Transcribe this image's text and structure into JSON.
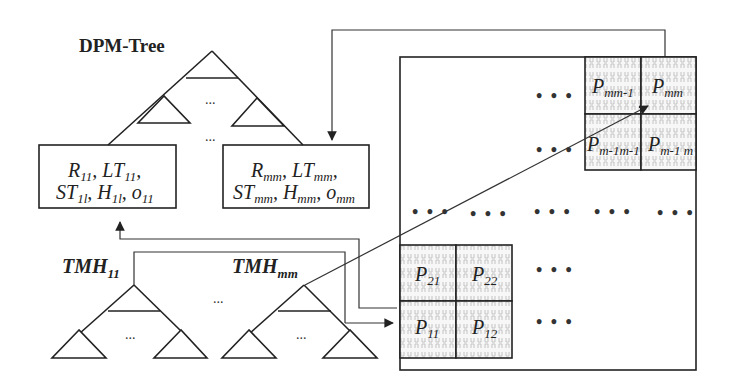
{
  "diagram": {
    "title": "DPM-Tree",
    "ellipsis": "...",
    "middle_dots": "…",
    "leaf_nodes": [
      {
        "id": "node-11",
        "line1": {
          "parts": [
            {
              "base": "R",
              "sub": "11"
            },
            {
              "base": ", LT",
              "sub": "11"
            },
            {
              "base": ",",
              "sub": ""
            }
          ]
        },
        "line2": {
          "parts": [
            {
              "base": "ST",
              "sub": "1l"
            },
            {
              "base": ", H",
              "sub": "1l"
            },
            {
              "base": ", o",
              "sub": "11"
            }
          ]
        }
      },
      {
        "id": "node-mm",
        "line1": {
          "parts": [
            {
              "base": "R",
              "sub": "mm"
            },
            {
              "base": ", LT",
              "sub": "mm"
            },
            {
              "base": ",",
              "sub": ""
            }
          ]
        },
        "line2": {
          "parts": [
            {
              "base": "ST",
              "sub": "mm"
            },
            {
              "base": ", H",
              "sub": "mm"
            },
            {
              "base": ", o",
              "sub": "mm"
            }
          ]
        }
      }
    ],
    "tmh_trees": [
      {
        "base": "TMH",
        "sub": "11"
      },
      {
        "base": "TMH",
        "sub": "mm"
      }
    ],
    "grid": {
      "top_right_cells": [
        {
          "base": "P",
          "sub": "mm-1"
        },
        {
          "base": "P",
          "sub": "mm"
        },
        {
          "base": "P",
          "sub": "m-1m-1"
        },
        {
          "base": "P",
          "sub": "m-1 m"
        }
      ],
      "bottom_left_cells": [
        {
          "base": "P",
          "sub": "21"
        },
        {
          "base": "P",
          "sub": "22"
        },
        {
          "base": "P",
          "sub": "11"
        },
        {
          "base": "P",
          "sub": "12"
        }
      ],
      "row_dots": "• • •"
    },
    "colors": {
      "line": "#222222",
      "pattern": "#bdbdbd",
      "background": "#ffffff"
    }
  }
}
